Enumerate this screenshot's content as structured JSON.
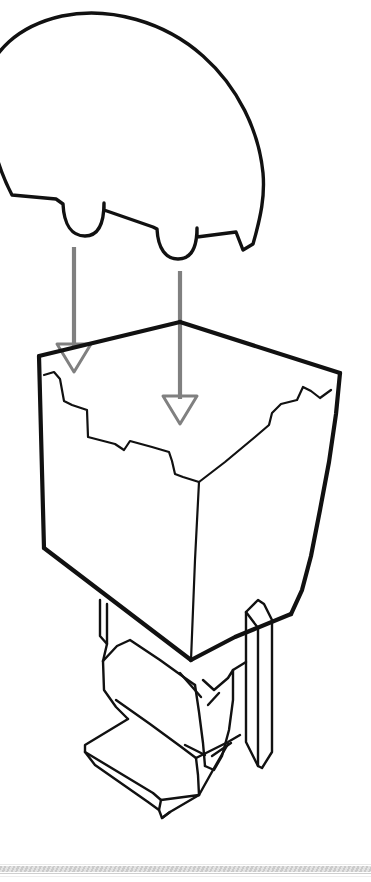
{
  "figure": {
    "title": "Dome lid insertion assembly diagram",
    "background_color": "#ffffff",
    "line_color": "#111111",
    "arrow_color": "#808080",
    "width": 371,
    "height": 882,
    "style": "technical line drawing, isometric exploded view"
  },
  "parts": [
    {
      "name": "dome-lid",
      "label": "Dome lid",
      "description": "Rounded dome-shaped cover with two U-shaped locating notches along its lower edge",
      "stroke_color": "#111111",
      "fill": "none"
    },
    {
      "name": "open-box",
      "label": "Open box",
      "description": "Open-top rectangular carton drawn in isometric projection with stepped inner rim and a narrow slot on the rear rim",
      "stroke_color": "#111111",
      "fill": "none"
    },
    {
      "name": "pedestal-base",
      "label": "Pedestal base",
      "description": "Folded stepped pedestal stand supporting the box underneath",
      "stroke_color": "#111111",
      "fill": "none"
    }
  ],
  "arrows": [
    {
      "name": "insertion-arrow-left",
      "label": "Insertion direction (left tab)",
      "direction": "down",
      "color": "#808080",
      "x": 74,
      "y_start": 247,
      "y_end": 372
    },
    {
      "name": "insertion-arrow-right",
      "label": "Insertion direction (right tab)",
      "direction": "down",
      "color": "#808080",
      "x": 180,
      "y_start": 271,
      "y_end": 424
    }
  ],
  "divider": {
    "name": "bottom-divider",
    "label": "Page divider strip",
    "color": "#c8c8c8",
    "y": 866,
    "height": 6
  }
}
